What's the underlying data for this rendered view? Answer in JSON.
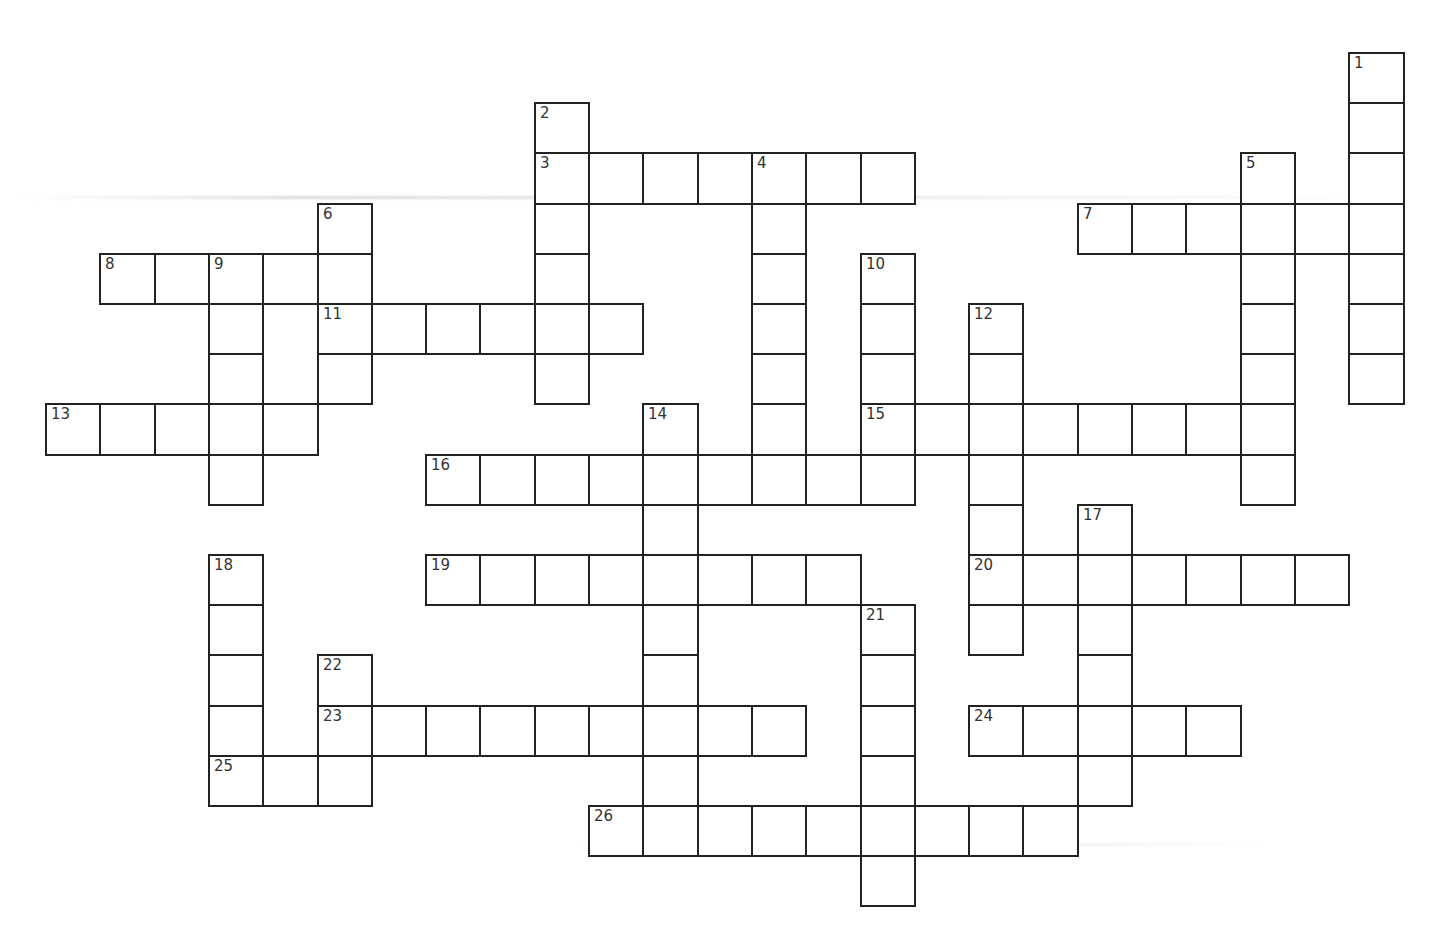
{
  "puzzle": {
    "title": "",
    "grid": {
      "origin_x": 46,
      "origin_y": 53,
      "cell_width": 54.3,
      "cell_height": 50.2
    },
    "colors": {
      "border": "#222222",
      "number": "#333333",
      "background": "#ffffff"
    },
    "words": [
      {
        "number": 1,
        "direction": "down",
        "row": 0,
        "col": 24,
        "length": 7
      },
      {
        "number": 2,
        "direction": "down",
        "row": 1,
        "col": 9,
        "length": 6
      },
      {
        "number": 3,
        "direction": "across",
        "row": 2,
        "col": 9,
        "length": 7
      },
      {
        "number": 4,
        "direction": "down",
        "row": 2,
        "col": 13,
        "length": 7
      },
      {
        "number": 5,
        "direction": "down",
        "row": 2,
        "col": 22,
        "length": 7
      },
      {
        "number": 6,
        "direction": "down",
        "row": 3,
        "col": 5,
        "length": 4
      },
      {
        "number": 7,
        "direction": "across",
        "row": 3,
        "col": 19,
        "length": 6
      },
      {
        "number": 8,
        "direction": "across",
        "row": 4,
        "col": 1,
        "length": 5
      },
      {
        "number": 9,
        "direction": "down",
        "row": 4,
        "col": 3,
        "length": 5
      },
      {
        "number": 10,
        "direction": "down",
        "row": 4,
        "col": 15,
        "length": 5
      },
      {
        "number": 11,
        "direction": "across",
        "row": 5,
        "col": 5,
        "length": 6
      },
      {
        "number": 12,
        "direction": "down",
        "row": 5,
        "col": 17,
        "length": 7
      },
      {
        "number": 13,
        "direction": "across",
        "row": 7,
        "col": 0,
        "length": 5
      },
      {
        "number": 14,
        "direction": "down",
        "row": 7,
        "col": 11,
        "length": 8
      },
      {
        "number": 15,
        "direction": "across",
        "row": 7,
        "col": 15,
        "length": 8
      },
      {
        "number": 16,
        "direction": "across",
        "row": 8,
        "col": 7,
        "length": 9
      },
      {
        "number": 17,
        "direction": "down",
        "row": 9,
        "col": 19,
        "length": 6
      },
      {
        "number": 18,
        "direction": "down",
        "row": 10,
        "col": 3,
        "length": 5
      },
      {
        "number": 19,
        "direction": "across",
        "row": 10,
        "col": 7,
        "length": 8
      },
      {
        "number": 20,
        "direction": "across",
        "row": 10,
        "col": 17,
        "length": 7
      },
      {
        "number": 21,
        "direction": "down",
        "row": 11,
        "col": 15,
        "length": 6
      },
      {
        "number": 22,
        "direction": "down",
        "row": 12,
        "col": 5,
        "length": 3
      },
      {
        "number": 23,
        "direction": "across",
        "row": 13,
        "col": 5,
        "length": 9
      },
      {
        "number": 24,
        "direction": "across",
        "row": 13,
        "col": 17,
        "length": 5
      },
      {
        "number": 25,
        "direction": "across",
        "row": 14,
        "col": 3,
        "length": 3
      },
      {
        "number": 26,
        "direction": "across",
        "row": 15,
        "col": 10,
        "length": 9
      }
    ],
    "numbers": {
      "1": "1",
      "2": "2",
      "3": "3",
      "4": "4",
      "5": "5",
      "6": "6",
      "7": "7",
      "8": "8",
      "9": "9",
      "10": "10",
      "11": "11",
      "12": "12",
      "13": "13",
      "14": "14",
      "15": "15",
      "16": "16",
      "17": "17",
      "18": "18",
      "19": "19",
      "20": "20",
      "21": "21",
      "22": "22",
      "23": "23",
      "24": "24",
      "25": "25",
      "26": "26"
    }
  },
  "artifacts": {
    "smudges": [
      {
        "x": 20,
        "y": 196,
        "width": 1380
      },
      {
        "x": 580,
        "y": 843,
        "width": 680
      }
    ]
  }
}
